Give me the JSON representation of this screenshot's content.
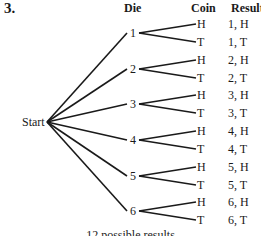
{
  "problem_number": "3.",
  "headers": {
    "die": "Die",
    "coin": "Coin",
    "result": "Result"
  },
  "root": "Start",
  "die_outcomes": [
    {
      "die": "1",
      "coins": [
        "H",
        "T"
      ],
      "results": [
        "1, H",
        "1, T"
      ]
    },
    {
      "die": "2",
      "coins": [
        "H",
        "T"
      ],
      "results": [
        "2, H",
        "2, T"
      ]
    },
    {
      "die": "3",
      "coins": [
        "H",
        "T"
      ],
      "results": [
        "3, H",
        "3, T"
      ]
    },
    {
      "die": "4",
      "coins": [
        "H",
        "T"
      ],
      "results": [
        "4, H",
        "4, T"
      ]
    },
    {
      "die": "5",
      "coins": [
        "H",
        "T"
      ],
      "results": [
        "5, H",
        "5, T"
      ]
    },
    {
      "die": "6",
      "coins": [
        "H",
        "T"
      ],
      "results": [
        "6, H",
        "6, T"
      ]
    }
  ],
  "caption": "12 possible results",
  "colors": {
    "line": "#1a1a1a",
    "text": "#1a1a1a",
    "background": "#ffffff"
  }
}
